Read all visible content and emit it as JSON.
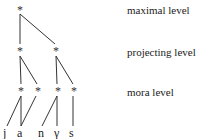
{
  "diagram": {
    "type": "metrical-tree",
    "levels": [
      {
        "id": "maximal",
        "label": "maximal level"
      },
      {
        "id": "projecting",
        "label": "projecting level"
      },
      {
        "id": "mora",
        "label": "mora level"
      }
    ],
    "node_symbol": "*",
    "segments": [
      "j",
      "a",
      "n",
      "γ",
      "s"
    ]
  }
}
